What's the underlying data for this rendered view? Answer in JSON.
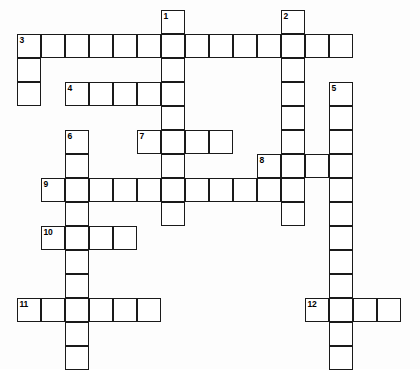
{
  "puzzle": {
    "title": "Crossword Puzzle Grid",
    "type": "crossword-grid",
    "cell_size_px": 24,
    "origin_x_px": 17,
    "origin_y_px": 10,
    "columns": 16,
    "rows": 15,
    "colors": {
      "background": "#ffffff",
      "page_background": "#fdfdfd",
      "cell_fill": "#ffffff",
      "cell_border": "#1a1a1a",
      "number_text": "#000000"
    },
    "numbered_clues": [
      {
        "number": "1",
        "col": 6,
        "row": 0,
        "direction": "down",
        "length": 9
      },
      {
        "number": "2",
        "col": 11,
        "row": 0,
        "direction": "down",
        "length": 9
      },
      {
        "number": "3",
        "col": 0,
        "row": 1,
        "direction": "across",
        "length": 14
      },
      {
        "number": "4",
        "col": 2,
        "row": 3,
        "direction": "across",
        "length": 5
      },
      {
        "number": "5",
        "col": 13,
        "row": 3,
        "direction": "down",
        "length": 12
      },
      {
        "number": "6",
        "col": 2,
        "row": 5,
        "direction": "down",
        "length": 10
      },
      {
        "number": "7",
        "col": 5,
        "row": 5,
        "direction": "across",
        "length": 4
      },
      {
        "number": "8",
        "col": 10,
        "row": 6,
        "direction": "across",
        "length": 4
      },
      {
        "number": "9",
        "col": 1,
        "row": 7,
        "direction": "across",
        "length": 11
      },
      {
        "number": "10",
        "col": 1,
        "row": 9,
        "direction": "across",
        "length": 4
      },
      {
        "number": "11",
        "col": 0,
        "row": 12,
        "direction": "across",
        "length": 6
      },
      {
        "number": "12",
        "col": 12,
        "row": 12,
        "direction": "across",
        "length": 4
      }
    ],
    "cells": [
      {
        "col": 6,
        "row": 0
      },
      {
        "col": 11,
        "row": 0
      },
      {
        "col": 0,
        "row": 1
      },
      {
        "col": 1,
        "row": 1
      },
      {
        "col": 2,
        "row": 1
      },
      {
        "col": 3,
        "row": 1
      },
      {
        "col": 4,
        "row": 1
      },
      {
        "col": 5,
        "row": 1
      },
      {
        "col": 6,
        "row": 1
      },
      {
        "col": 7,
        "row": 1
      },
      {
        "col": 8,
        "row": 1
      },
      {
        "col": 9,
        "row": 1
      },
      {
        "col": 10,
        "row": 1
      },
      {
        "col": 11,
        "row": 1
      },
      {
        "col": 12,
        "row": 1
      },
      {
        "col": 13,
        "row": 1
      },
      {
        "col": 0,
        "row": 2
      },
      {
        "col": 6,
        "row": 2
      },
      {
        "col": 11,
        "row": 2
      },
      {
        "col": 0,
        "row": 3
      },
      {
        "col": 2,
        "row": 3
      },
      {
        "col": 3,
        "row": 3
      },
      {
        "col": 4,
        "row": 3
      },
      {
        "col": 5,
        "row": 3
      },
      {
        "col": 6,
        "row": 3
      },
      {
        "col": 11,
        "row": 3
      },
      {
        "col": 13,
        "row": 3
      },
      {
        "col": 6,
        "row": 4
      },
      {
        "col": 11,
        "row": 4
      },
      {
        "col": 13,
        "row": 4
      },
      {
        "col": 2,
        "row": 5
      },
      {
        "col": 5,
        "row": 5
      },
      {
        "col": 6,
        "row": 5
      },
      {
        "col": 7,
        "row": 5
      },
      {
        "col": 8,
        "row": 5
      },
      {
        "col": 11,
        "row": 5
      },
      {
        "col": 13,
        "row": 5
      },
      {
        "col": 2,
        "row": 6
      },
      {
        "col": 6,
        "row": 6
      },
      {
        "col": 10,
        "row": 6
      },
      {
        "col": 11,
        "row": 6
      },
      {
        "col": 12,
        "row": 6
      },
      {
        "col": 13,
        "row": 6
      },
      {
        "col": 1,
        "row": 7
      },
      {
        "col": 2,
        "row": 7
      },
      {
        "col": 3,
        "row": 7
      },
      {
        "col": 4,
        "row": 7
      },
      {
        "col": 5,
        "row": 7
      },
      {
        "col": 6,
        "row": 7
      },
      {
        "col": 7,
        "row": 7
      },
      {
        "col": 8,
        "row": 7
      },
      {
        "col": 9,
        "row": 7
      },
      {
        "col": 10,
        "row": 7
      },
      {
        "col": 11,
        "row": 7
      },
      {
        "col": 13,
        "row": 7
      },
      {
        "col": 2,
        "row": 8
      },
      {
        "col": 6,
        "row": 8
      },
      {
        "col": 11,
        "row": 8
      },
      {
        "col": 13,
        "row": 8
      },
      {
        "col": 1,
        "row": 9
      },
      {
        "col": 2,
        "row": 9
      },
      {
        "col": 3,
        "row": 9
      },
      {
        "col": 4,
        "row": 9
      },
      {
        "col": 13,
        "row": 9
      },
      {
        "col": 2,
        "row": 10
      },
      {
        "col": 13,
        "row": 10
      },
      {
        "col": 2,
        "row": 11
      },
      {
        "col": 13,
        "row": 11
      },
      {
        "col": 0,
        "row": 12
      },
      {
        "col": 1,
        "row": 12
      },
      {
        "col": 2,
        "row": 12
      },
      {
        "col": 3,
        "row": 12
      },
      {
        "col": 4,
        "row": 12
      },
      {
        "col": 5,
        "row": 12
      },
      {
        "col": 12,
        "row": 12
      },
      {
        "col": 13,
        "row": 12
      },
      {
        "col": 14,
        "row": 12
      },
      {
        "col": 15,
        "row": 12
      },
      {
        "col": 2,
        "row": 13
      },
      {
        "col": 13,
        "row": 13
      },
      {
        "col": 2,
        "row": 14
      },
      {
        "col": 13,
        "row": 14
      }
    ]
  }
}
